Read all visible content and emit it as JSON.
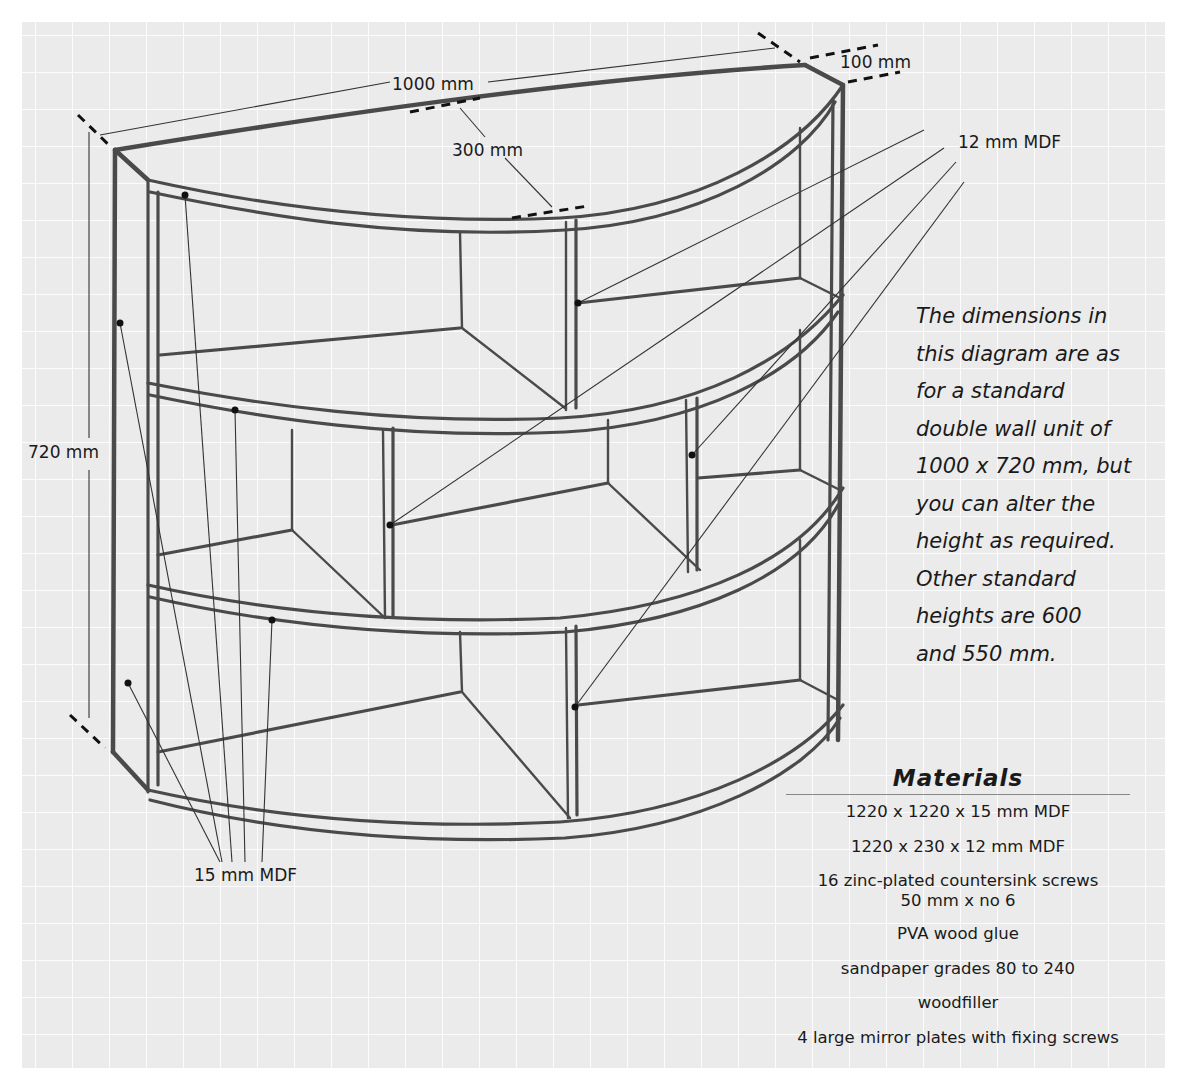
{
  "diagram": {
    "colors": {
      "panel_background": "#ebebeb",
      "grid_lines": "#ffffff",
      "pencil_stroke": "#4a4a4a",
      "text": "#1a1a1a"
    },
    "dimension_labels": {
      "width": "1000 mm",
      "depth": "300 mm",
      "top_overhang": "100 mm",
      "height": "720 mm"
    },
    "material_callouts": {
      "thin_board": "12 mm MDF",
      "thick_board": "15 mm MDF"
    },
    "note": {
      "lines": [
        "The dimensions in",
        "this diagram are as",
        "for a standard",
        "double wall unit of",
        "1000 x 720 mm, but",
        "you can alter the",
        "height as required.",
        "Other standard",
        "heights are 600",
        "and 550 mm."
      ]
    },
    "materials": {
      "title": "Materials",
      "items": [
        "1220 x 1220 x 15 mm MDF",
        "1220 x 230 x 12 mm MDF",
        "16 zinc-plated countersink screws",
        "50 mm x no 6",
        "PVA wood glue",
        "sandpaper grades 80 to 240",
        "woodfiller",
        "4 large mirror plates with fixing screws"
      ]
    }
  }
}
